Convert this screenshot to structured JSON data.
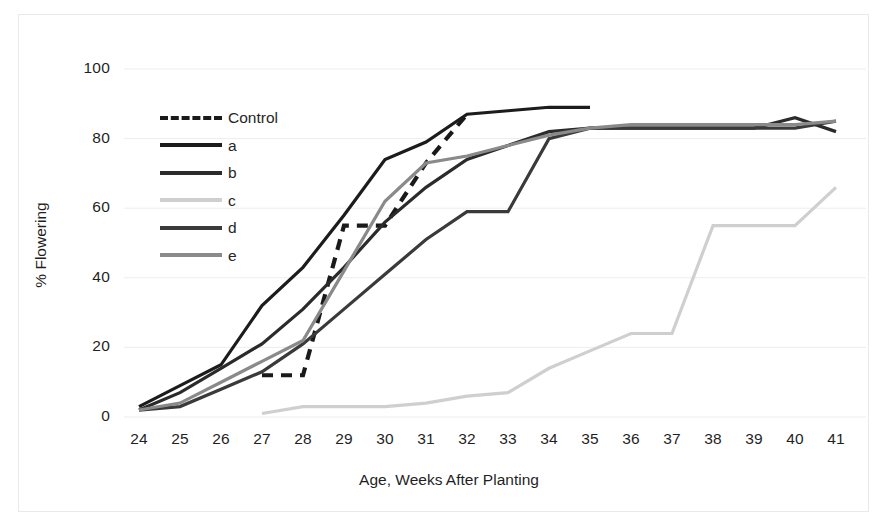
{
  "chart_data": {
    "type": "line",
    "title": "",
    "xlabel": "Age, Weeks After Planting",
    "ylabel": "% Flowering",
    "xlim": [
      23.5,
      41.5
    ],
    "ylim": [
      0,
      100
    ],
    "yticks": [
      0,
      20,
      40,
      60,
      80,
      100
    ],
    "xticks": [
      24,
      25,
      26,
      27,
      28,
      29,
      30,
      31,
      32,
      33,
      34,
      35,
      36,
      37,
      38,
      39,
      40,
      41
    ],
    "grid": true,
    "legend_position": "upper-left-inside",
    "series": [
      {
        "name": "Control",
        "style": "dashed",
        "color": "#1a1a1a",
        "x": [
          27,
          28,
          29,
          30,
          31,
          32
        ],
        "values": [
          12,
          12,
          55,
          55,
          73,
          87
        ]
      },
      {
        "name": "a",
        "style": "solid",
        "color": "#1c1c1c",
        "x": [
          24,
          25,
          26,
          27,
          28,
          29,
          30,
          31,
          32,
          33,
          34,
          35
        ],
        "values": [
          3,
          9,
          15,
          32,
          43,
          58,
          74,
          79,
          87,
          88,
          89,
          89
        ]
      },
      {
        "name": "b",
        "style": "solid",
        "color": "#2b2b2b",
        "x": [
          24,
          25,
          26,
          27,
          28,
          29,
          30,
          31,
          32,
          33,
          34,
          35,
          36,
          37,
          38,
          39,
          40,
          41
        ],
        "values": [
          2,
          7,
          14,
          21,
          31,
          43,
          56,
          66,
          74,
          78,
          82,
          83,
          83,
          83,
          83,
          83,
          86,
          82
        ]
      },
      {
        "name": "c",
        "style": "solid",
        "color": "#cfcfcf",
        "x": [
          27,
          28,
          29,
          30,
          31,
          32,
          33,
          34,
          35,
          36,
          37,
          38,
          39,
          40,
          41
        ],
        "values": [
          1,
          3,
          3,
          3,
          4,
          6,
          7,
          14,
          19,
          24,
          24,
          55,
          55,
          55,
          66
        ]
      },
      {
        "name": "d",
        "style": "solid",
        "color": "#3a3a3a",
        "x": [
          24,
          25,
          26,
          27,
          28,
          29,
          30,
          31,
          32,
          33,
          34,
          35,
          36,
          37,
          38,
          39,
          40,
          41
        ],
        "values": [
          2,
          3,
          8,
          13,
          21,
          31,
          41,
          51,
          59,
          59,
          80,
          83,
          83,
          83,
          83,
          83,
          83,
          85
        ]
      },
      {
        "name": "e",
        "style": "solid",
        "color": "#8a8a8a",
        "x": [
          24,
          25,
          26,
          27,
          28,
          29,
          30,
          31,
          32,
          33,
          34,
          35,
          36,
          37,
          38,
          39,
          40,
          41
        ],
        "values": [
          2,
          4,
          10,
          16,
          22,
          42,
          62,
          73,
          75,
          78,
          81,
          83,
          84,
          84,
          84,
          84,
          84,
          85
        ]
      }
    ]
  },
  "axes": {
    "y_tick_labels": [
      "0",
      "20",
      "40",
      "60",
      "80",
      "100"
    ],
    "x_tick_labels": [
      "24",
      "25",
      "26",
      "27",
      "28",
      "29",
      "30",
      "31",
      "32",
      "33",
      "34",
      "35",
      "36",
      "37",
      "38",
      "39",
      "40",
      "41"
    ],
    "x_axis_title": "Age, Weeks After Planting",
    "y_axis_title": "% Flowering"
  },
  "legend": {
    "items": [
      {
        "label": "Control"
      },
      {
        "label": "a"
      },
      {
        "label": "b"
      },
      {
        "label": "c"
      },
      {
        "label": "d"
      },
      {
        "label": "e"
      }
    ]
  }
}
